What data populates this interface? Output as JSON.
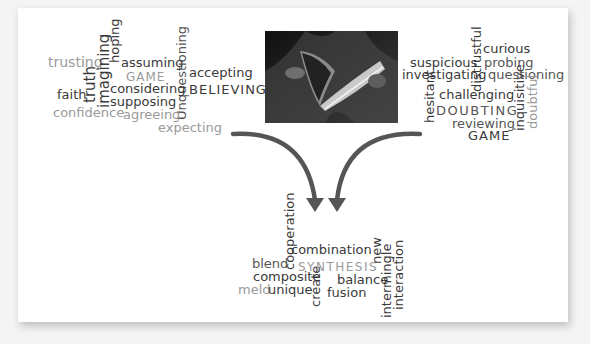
{
  "believing_cloud": {
    "title_word": "BELIEVING",
    "words": [
      {
        "text": "trusting",
        "tone": "light"
      },
      {
        "text": "truth",
        "tone": "dark"
      },
      {
        "text": "imagining",
        "tone": "dark"
      },
      {
        "text": "hoping",
        "tone": "dark"
      },
      {
        "text": "assuming",
        "tone": "dark"
      },
      {
        "text": "GAME",
        "tone": "light"
      },
      {
        "text": "Unquestioning",
        "tone": "mid"
      },
      {
        "text": "accepting",
        "tone": "dark"
      },
      {
        "text": "faith",
        "tone": "dark"
      },
      {
        "text": "considering",
        "tone": "dark"
      },
      {
        "text": "BELIEVING",
        "tone": "dark"
      },
      {
        "text": "supposing",
        "tone": "dark"
      },
      {
        "text": "confidence",
        "tone": "light"
      },
      {
        "text": "agreeing",
        "tone": "light"
      },
      {
        "text": "expecting",
        "tone": "light"
      }
    ]
  },
  "doubting_cloud": {
    "title_word": "DOUBTING",
    "words": [
      {
        "text": "curious",
        "tone": "dark"
      },
      {
        "text": "distrustful",
        "tone": "dark"
      },
      {
        "text": "suspicious",
        "tone": "dark"
      },
      {
        "text": "probing",
        "tone": "mid"
      },
      {
        "text": "investigating",
        "tone": "dark"
      },
      {
        "text": "questioning",
        "tone": "mid"
      },
      {
        "text": "hesitant",
        "tone": "dark"
      },
      {
        "text": "challenging",
        "tone": "dark"
      },
      {
        "text": "inquisitive",
        "tone": "dark"
      },
      {
        "text": "doubtful",
        "tone": "light"
      },
      {
        "text": "DOUBTING",
        "tone": "mid"
      },
      {
        "text": "reviewing",
        "tone": "mid"
      },
      {
        "text": "GAME",
        "tone": "dark"
      }
    ]
  },
  "synthesis_cloud": {
    "title_word": "SYNTHESIS",
    "words": [
      {
        "text": "cooperation",
        "tone": "dark"
      },
      {
        "text": "combination",
        "tone": "dark"
      },
      {
        "text": "new",
        "tone": "dark"
      },
      {
        "text": "blend",
        "tone": "mid"
      },
      {
        "text": "SYNTHESIS",
        "tone": "light"
      },
      {
        "text": "composite",
        "tone": "dark"
      },
      {
        "text": "intermingle",
        "tone": "dark"
      },
      {
        "text": "interaction",
        "tone": "dark"
      },
      {
        "text": "meld",
        "tone": "light"
      },
      {
        "text": "unique",
        "tone": "dark"
      },
      {
        "text": "create",
        "tone": "dark"
      },
      {
        "text": "balance",
        "tone": "dark"
      },
      {
        "text": "fusion",
        "tone": "dark"
      }
    ]
  },
  "photo": {
    "subject": "person-reading-magazine-photo"
  },
  "colors": {
    "dark": "#3a3a3a",
    "mid": "#555555",
    "light": "#9a9a9a",
    "arrow": "#555555",
    "card": "#ffffff",
    "background": "#f4f4f4"
  }
}
